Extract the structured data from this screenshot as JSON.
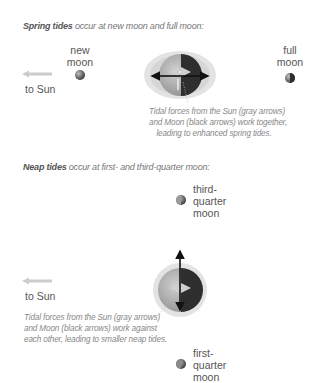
{
  "spring": {
    "title_bold": "Spring tides",
    "title_rest": " occur at new moon and full moon:",
    "new_moon_label": [
      "new",
      "moon"
    ],
    "full_moon_label": [
      "full",
      "moon"
    ],
    "sun_label": "to Sun",
    "caption": [
      "Tidal forces from the Sun (gray arrows)",
      "and Moon (black arrows) work together,",
      "leading to enhanced spring tides."
    ]
  },
  "neap": {
    "title_bold": "Neap tides",
    "title_rest": " occur at first- and third-quarter moon:",
    "third_quarter_label": [
      "third-",
      "quarter",
      "moon"
    ],
    "first_quarter_label": [
      "first-",
      "quarter",
      "moon"
    ],
    "sun_label": "to Sun",
    "caption": [
      "Tidal forces from the Sun (gray arrows)",
      "and Moon (black arrows) work against",
      "each other, leading to smaller neap tides."
    ]
  },
  "colors": {
    "ocean_bulge": "#e0e0e0",
    "earth_lit": "#a8a8a8",
    "earth_dark": "#2e2e2e",
    "sun_arrow": "#cccccc",
    "moon_arrow": "#111111",
    "text": "#555555",
    "caption": "#888888"
  }
}
